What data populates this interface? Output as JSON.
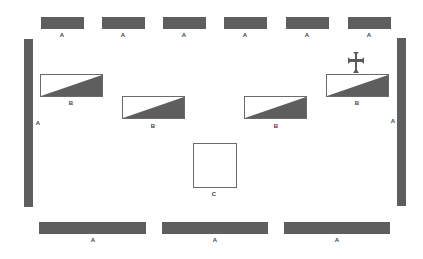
{
  "diagram": {
    "type": "floor-plan-layout",
    "colors": {
      "bar_fill": "#5e5e5e",
      "outline": "#6a6a6a",
      "background": "#ffffff"
    },
    "top_row": [
      {
        "label": "A"
      },
      {
        "label": "A"
      },
      {
        "label": "A"
      },
      {
        "label": "A"
      },
      {
        "label": "A"
      },
      {
        "label": "A"
      }
    ],
    "left_side": {
      "label": "A"
    },
    "right_side": {
      "label": "A"
    },
    "b_elements": [
      {
        "label": "B"
      },
      {
        "label": "B"
      },
      {
        "label": "B"
      },
      {
        "label": "B",
        "marker": "cross-icon"
      }
    ],
    "center": {
      "label": "C"
    },
    "bottom_row": [
      {
        "label": "A"
      },
      {
        "label": "A"
      },
      {
        "label": "A"
      }
    ]
  }
}
